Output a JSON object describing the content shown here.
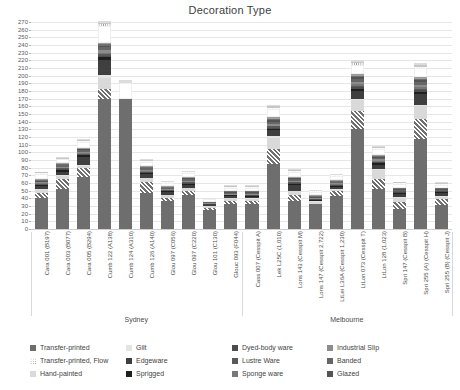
{
  "chart": {
    "title": "Decoration Type",
    "type": "bar"
  },
  "chart_data": {
    "type": "bar",
    "title": "Decoration Type",
    "subtype": "stacked-vertical-bar",
    "xlabel": "",
    "ylabel": "",
    "ylim": [
      0,
      270
    ],
    "ytick_step": 10,
    "grid": true,
    "legend_position": "bottom",
    "yticks": [
      0,
      10,
      20,
      30,
      40,
      50,
      60,
      70,
      80,
      90,
      100,
      110,
      120,
      130,
      140,
      150,
      160,
      170,
      180,
      190,
      200,
      210,
      220,
      230,
      240,
      250,
      260,
      270
    ],
    "group_labels": [
      "Sydney",
      "Melbourne"
    ],
    "categories": [
      "Cara 001 (B197)",
      "Cara 003 (B077)",
      "Cara 005 (B294)",
      "Cumb 122 (A138)",
      "Cumb 124 (A310)",
      "Cumb 126 (A140)",
      "Glou 097 (C056)",
      "Glou 097 (C220)",
      "Glou 101 (C130)",
      "Glouc 093 (F044)",
      "Cass 007 (Cesspit A)",
      "Lek L25C (1,010)",
      "Lons 143 (Cesspit M)",
      "Lons 147 (Cesspit 2,722)",
      "LtLei L36A (Cesspit 1,230)",
      "LtLon 073 (Cesspit T)",
      "LtLon 128 (1,023)",
      "Spri 147 (Cesspit B)",
      "Spri 255 (A) (Cesspit H)",
      "Spri 255 (B) (Cesspit J)"
    ],
    "series": [
      {
        "name": "Transfer-printed",
        "color": "#6e6e6e",
        "pattern": "solid",
        "values": [
          41,
          52,
          68,
          170,
          170,
          47,
          37,
          44,
          25,
          32,
          33,
          85,
          36,
          32,
          43,
          130,
          52,
          26,
          118,
          31
        ]
      },
      {
        "name": "Transfer-printed, Flow",
        "color": "#ffffff",
        "pattern": "hatch",
        "values": [
          6,
          13,
          12,
          12,
          0,
          14,
          4,
          6,
          3,
          5,
          4,
          20,
          8,
          0,
          6,
          24,
          13,
          9,
          26,
          8
        ]
      },
      {
        "name": "Hand-painted",
        "color": "#d9d9d9",
        "pattern": "solid",
        "values": [
          4,
          4,
          2,
          15,
          0,
          5,
          3,
          3,
          2,
          3,
          2,
          14,
          5,
          3,
          2,
          14,
          12,
          6,
          16,
          3
        ]
      },
      {
        "name": "Gilt",
        "color": "#e4e4e4",
        "pattern": "solid",
        "values": [
          1,
          1,
          1,
          4,
          0,
          1,
          1,
          1,
          0,
          1,
          1,
          2,
          1,
          1,
          1,
          2,
          1,
          1,
          2,
          1
        ]
      },
      {
        "name": "Edgeware",
        "color": "#3f3f3f",
        "pattern": "solid",
        "values": [
          4,
          5,
          11,
          20,
          0,
          5,
          3,
          4,
          2,
          2,
          2,
          8,
          8,
          1,
          3,
          10,
          6,
          4,
          14,
          4
        ]
      },
      {
        "name": "Sprigged",
        "color": "#1f1f1f",
        "pattern": "solid",
        "values": [
          1,
          2,
          2,
          3,
          0,
          1,
          1,
          1,
          1,
          1,
          1,
          2,
          1,
          1,
          1,
          3,
          2,
          1,
          3,
          1
        ]
      },
      {
        "name": "Dyed-body ware",
        "color": "#4d4d4d",
        "pattern": "solid",
        "values": [
          1,
          1,
          1,
          2,
          0,
          1,
          1,
          1,
          0,
          1,
          1,
          1,
          1,
          1,
          1,
          2,
          1,
          1,
          2,
          1
        ]
      },
      {
        "name": "Lustre Ware",
        "color": "#595959",
        "pattern": "solid",
        "values": [
          1,
          1,
          1,
          2,
          0,
          1,
          1,
          1,
          0,
          0,
          1,
          2,
          1,
          0,
          1,
          2,
          1,
          1,
          2,
          0
        ]
      },
      {
        "name": "Sponge ware",
        "color": "#777777",
        "pattern": "solid",
        "values": [
          1,
          1,
          1,
          2,
          0,
          1,
          0,
          1,
          0,
          0,
          0,
          1,
          1,
          0,
          1,
          2,
          1,
          0,
          2,
          0
        ]
      },
      {
        "name": "Industrial Slip",
        "color": "#8c8c8c",
        "pattern": "solid",
        "values": [
          1,
          1,
          2,
          3,
          0,
          1,
          1,
          1,
          1,
          1,
          1,
          2,
          1,
          1,
          1,
          3,
          2,
          1,
          3,
          1
        ]
      },
      {
        "name": "Banded",
        "color": "#666666",
        "pattern": "solid",
        "values": [
          1,
          2,
          2,
          4,
          0,
          2,
          1,
          2,
          1,
          1,
          1,
          3,
          2,
          1,
          1,
          4,
          2,
          1,
          4,
          1
        ]
      },
      {
        "name": "Glazed",
        "color": "#545454",
        "pattern": "solid",
        "values": [
          1,
          1,
          1,
          2,
          0,
          1,
          1,
          1,
          0,
          1,
          1,
          2,
          1,
          1,
          1,
          2,
          1,
          1,
          2,
          1
        ]
      },
      {
        "name": "Rockingham",
        "color": "#707070",
        "pattern": "solid",
        "values": [
          1,
          1,
          1,
          2,
          0,
          1,
          1,
          1,
          0,
          1,
          1,
          2,
          1,
          1,
          1,
          2,
          1,
          1,
          2,
          1
        ]
      },
      {
        "name": "Moulded",
        "color": "#9e9e9e",
        "pattern": "solid",
        "values": [
          1,
          1,
          1,
          2,
          0,
          1,
          1,
          1,
          0,
          1,
          1,
          2,
          1,
          1,
          1,
          2,
          1,
          1,
          2,
          1
        ]
      },
      {
        "name": "Whiteware",
        "color": "#ffffff",
        "pattern": "solid",
        "values": [
          7,
          5,
          8,
          22,
          20,
          6,
          4,
          5,
          4,
          4,
          4,
          10,
          7,
          4,
          5,
          12,
          9,
          5,
          12,
          4
        ]
      },
      {
        "name": "White Granite",
        "color": "#f2f2f2",
        "pattern": "dots",
        "values": [
          1,
          1,
          1,
          2,
          0,
          1,
          1,
          1,
          0,
          1,
          1,
          2,
          1,
          1,
          1,
          2,
          1,
          1,
          2,
          1
        ]
      },
      {
        "name": "Chinese",
        "color": "#c6c6c6",
        "pattern": "solid",
        "values": [
          1,
          1,
          1,
          2,
          0,
          1,
          1,
          1,
          0,
          1,
          1,
          2,
          1,
          1,
          1,
          2,
          1,
          1,
          2,
          1
        ]
      },
      {
        "name": "Other",
        "color": "#dcdcdc",
        "pattern": "solid",
        "values": [
          1,
          1,
          1,
          2,
          5,
          1,
          1,
          1,
          0,
          1,
          1,
          2,
          1,
          1,
          1,
          2,
          1,
          1,
          2,
          1
        ]
      }
    ]
  },
  "legend": {
    "entries": [
      {
        "label": "Transfer-printed",
        "color": "#6e6e6e",
        "pattern": "solid"
      },
      {
        "label": "Transfer-printed, Flow",
        "color": "#ffffff",
        "pattern": "dots"
      },
      {
        "label": "Hand-painted",
        "color": "#d9d9d9",
        "pattern": "solid"
      },
      {
        "label": "Gilt",
        "color": "#e4e4e4",
        "pattern": "solid"
      },
      {
        "label": "Edgeware",
        "color": "#3f3f3f",
        "pattern": "solid"
      },
      {
        "label": "Sprigged",
        "color": "#1f1f1f",
        "pattern": "solid"
      },
      {
        "label": "Dyed-body ware",
        "color": "#4d4d4d",
        "pattern": "solid"
      },
      {
        "label": "Lustre Ware",
        "color": "#595959",
        "pattern": "solid"
      },
      {
        "label": "Sponge ware",
        "color": "#777777",
        "pattern": "solid"
      },
      {
        "label": "Industrial Slip",
        "color": "#8c8c8c",
        "pattern": "solid"
      },
      {
        "label": "Banded",
        "color": "#666666",
        "pattern": "solid"
      },
      {
        "label": "Glazed",
        "color": "#545454",
        "pattern": "solid"
      },
      {
        "label": "Rockingham",
        "color": "#707070",
        "pattern": "solid"
      },
      {
        "label": "Moulded",
        "color": "#9e9e9e",
        "pattern": "solid"
      },
      {
        "label": "Whiteware",
        "color": "#ffffff",
        "pattern": "none"
      },
      {
        "label": "White Granite",
        "color": "#f2f2f2",
        "pattern": "dots"
      },
      {
        "label": "Chinese",
        "color": "#c6c6c6",
        "pattern": "solid"
      },
      {
        "label": "Other",
        "color": "#dcdcdc",
        "pattern": "solid"
      }
    ]
  }
}
